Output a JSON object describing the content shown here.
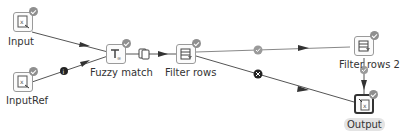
{
  "diagram": {
    "nodes": [
      {
        "id": "input",
        "label": "Input",
        "type": "input-step"
      },
      {
        "id": "inputref",
        "label": "InputRef",
        "type": "input-step"
      },
      {
        "id": "fuzzy",
        "label": "Fuzzy match",
        "type": "fuzzy-match-step"
      },
      {
        "id": "filter1",
        "label": "Filter rows",
        "type": "filter-step"
      },
      {
        "id": "filter2",
        "label": "Filter rows 2",
        "type": "filter-step"
      },
      {
        "id": "output",
        "label": "Output",
        "type": "output-step",
        "selected": true
      }
    ],
    "edges": [
      {
        "from": "input",
        "to": "fuzzy",
        "badge": "none"
      },
      {
        "from": "inputref",
        "to": "fuzzy",
        "badge": "info"
      },
      {
        "from": "fuzzy",
        "to": "filter1",
        "badge": "copy"
      },
      {
        "from": "filter1",
        "to": "filter2",
        "badge": "true-check"
      },
      {
        "from": "filter1",
        "to": "output",
        "badge": "false-x"
      },
      {
        "from": "filter2",
        "to": "output",
        "badge": "true-check"
      }
    ],
    "colors": {
      "line": "#555555",
      "badge": "#8f8f8f",
      "badge_dark": "#333333",
      "selected_label_bg": "#e4e4e4"
    }
  }
}
